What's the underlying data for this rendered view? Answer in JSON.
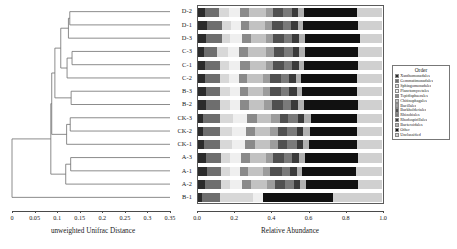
{
  "figure": {
    "type": "dendrogram-stacked-bar",
    "background": "#ffffff"
  },
  "dendrogram": {
    "axis_title": "unweighted Unifrac Distance",
    "tick_labels": [
      "0",
      "0.05",
      "0.1",
      "0.15",
      "0.2",
      "0.25",
      "0.3",
      "0.35"
    ],
    "tick_values": [
      0,
      0.05,
      0.1,
      0.15,
      0.2,
      0.25,
      0.3,
      0.35
    ],
    "axis_range": [
      0,
      0.35
    ],
    "line_color": "#6a6a6a",
    "leaf_order": [
      "D-2",
      "D-1",
      "D-3",
      "C-3",
      "C-1",
      "C-2",
      "B-3",
      "B-2",
      "CK-3",
      "CK-2",
      "CK-1",
      "A-3",
      "A-1",
      "A-2",
      "B-1"
    ],
    "merges": [
      {
        "name": "D2-D1",
        "members": [
          "D-2",
          "D-1"
        ],
        "height": 0.128
      },
      {
        "name": "D21-D3",
        "members": [
          "D2-D1",
          "D-3"
        ],
        "height": 0.125
      },
      {
        "name": "C3-C1",
        "members": [
          "C-3",
          "C-1"
        ],
        "height": 0.133
      },
      {
        "name": "C31-C2",
        "members": [
          "C3-C1",
          "C-2"
        ],
        "height": 0.122
      },
      {
        "name": "D-C",
        "members": [
          "D21-D3",
          "C31-C2"
        ],
        "height": 0.108
      },
      {
        "name": "B3-B2",
        "members": [
          "B-3",
          "B-2"
        ],
        "height": 0.131
      },
      {
        "name": "DC-B",
        "members": [
          "D-C",
          "B3-B2"
        ],
        "height": 0.095
      },
      {
        "name": "CK3-CK2",
        "members": [
          "CK-3",
          "CK-2"
        ],
        "height": 0.129
      },
      {
        "name": "CK-all",
        "members": [
          "CK3-CK2",
          "CK-1"
        ],
        "height": 0.121
      },
      {
        "name": "DCB-CK",
        "members": [
          "DC-B",
          "CK-all"
        ],
        "height": 0.088
      },
      {
        "name": "A3-A1",
        "members": [
          "A-3",
          "A-1"
        ],
        "height": 0.13
      },
      {
        "name": "A-all",
        "members": [
          "A3-A1",
          "A-2"
        ],
        "height": 0.119
      },
      {
        "name": "upper-A",
        "members": [
          "DCB-CK",
          "A-all"
        ],
        "height": 0.086
      },
      {
        "name": "root",
        "members": [
          "upper-A",
          "B-1"
        ],
        "height": 0.0
      }
    ]
  },
  "chart_data": {
    "type": "bar",
    "orientation": "horizontal",
    "stacked": true,
    "normalized": true,
    "title": "",
    "xlabel": "Relative Abundance",
    "ylabel": "",
    "xlim": [
      0.0,
      1.0
    ],
    "xtick_labels": [
      "0.0",
      "0.2",
      "0.4",
      "0.6",
      "0.8",
      "1.0"
    ],
    "xtick_values": [
      0.0,
      0.2,
      0.4,
      0.6,
      0.8,
      1.0
    ],
    "grid": false,
    "legend_position": "right",
    "legend_title": "Order",
    "categories": [
      "D-2",
      "D-1",
      "D-3",
      "C-3",
      "C-1",
      "C-2",
      "B-3",
      "B-2",
      "CK-3",
      "CK-2",
      "CK-1",
      "A-3",
      "A-1",
      "A-2",
      "B-1"
    ],
    "series": [
      {
        "name": "Xanthomonadales",
        "color": "#2b2b2b",
        "values": [
          0.04,
          0.05,
          0.045,
          0.035,
          0.042,
          0.038,
          0.048,
          0.044,
          0.03,
          0.032,
          0.034,
          0.046,
          0.05,
          0.042,
          0.022
        ]
      },
      {
        "name": "Gemmatimonadales",
        "color": "#6e6e6e",
        "values": [
          0.075,
          0.08,
          0.085,
          0.07,
          0.078,
          0.082,
          0.072,
          0.076,
          0.09,
          0.088,
          0.086,
          0.08,
          0.078,
          0.084,
          0.1
        ]
      },
      {
        "name": "Sphingomonadales",
        "color": "#d8d8d8",
        "values": [
          0.055,
          0.05,
          0.048,
          0.06,
          0.052,
          0.05,
          0.056,
          0.054,
          0.07,
          0.068,
          0.066,
          0.05,
          0.046,
          0.052,
          0.18
        ]
      },
      {
        "name": "Planctomycetales",
        "color": "#efefef",
        "values": [
          0.06,
          0.055,
          0.062,
          0.058,
          0.06,
          0.054,
          0.052,
          0.056,
          0.075,
          0.072,
          0.07,
          0.058,
          0.054,
          0.06,
          0.05
        ]
      },
      {
        "name": "Tepidisphaerales",
        "color": "#8a8a8a",
        "values": [
          0.05,
          0.045,
          0.048,
          0.052,
          0.05,
          0.046,
          0.044,
          0.048,
          0.055,
          0.052,
          0.054,
          0.048,
          0.044,
          0.05,
          0.0
        ]
      },
      {
        "name": "Chitinophagales",
        "color": "#c2c2c2",
        "values": [
          0.09,
          0.085,
          0.08,
          0.095,
          0.088,
          0.086,
          0.082,
          0.084,
          0.075,
          0.078,
          0.08,
          0.086,
          0.082,
          0.088,
          0.0
        ]
      },
      {
        "name": "Bacillales",
        "color": "#9c9c9c",
        "values": [
          0.04,
          0.038,
          0.042,
          0.044,
          0.04,
          0.036,
          0.038,
          0.04,
          0.05,
          0.048,
          0.046,
          0.04,
          0.038,
          0.042,
          0.0
        ]
      },
      {
        "name": "Burkholderiales",
        "color": "#505050",
        "values": [
          0.055,
          0.06,
          0.058,
          0.052,
          0.056,
          0.06,
          0.062,
          0.058,
          0.045,
          0.048,
          0.05,
          0.06,
          0.064,
          0.056,
          0.0
        ]
      },
      {
        "name": "Rhizobiales",
        "color": "#7a7a7a",
        "values": [
          0.045,
          0.042,
          0.044,
          0.048,
          0.046,
          0.044,
          0.042,
          0.046,
          0.055,
          0.052,
          0.05,
          0.044,
          0.042,
          0.046,
          0.0
        ]
      },
      {
        "name": "Rhodospirillales",
        "color": "#3a3a3a",
        "values": [
          0.035,
          0.038,
          0.036,
          0.034,
          0.036,
          0.038,
          0.04,
          0.036,
          0.03,
          0.032,
          0.034,
          0.038,
          0.04,
          0.036,
          0.0
        ]
      },
      {
        "name": "Bacteroidales",
        "color": "#b0b0b0",
        "values": [
          0.03,
          0.028,
          0.032,
          0.034,
          0.03,
          0.028,
          0.03,
          0.032,
          0.038,
          0.036,
          0.034,
          0.03,
          0.028,
          0.032,
          0.0
        ]
      },
      {
        "name": "Other",
        "color": "#111111",
        "values": [
          0.29,
          0.295,
          0.3,
          0.285,
          0.292,
          0.298,
          0.294,
          0.296,
          0.25,
          0.254,
          0.256,
          0.29,
          0.294,
          0.282,
          0.38
        ]
      },
      {
        "name": "Unclassified",
        "color": "#d0d0d0",
        "values": [
          0.135,
          0.134,
          0.12,
          0.133,
          0.13,
          0.14,
          0.14,
          0.13,
          0.137,
          0.14,
          0.14,
          0.13,
          0.14,
          0.13,
          0.268
        ]
      }
    ]
  }
}
